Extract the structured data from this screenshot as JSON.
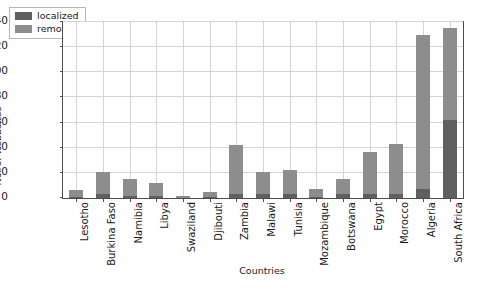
{
  "chart_data": {
    "type": "bar",
    "subtype": "stacked-vertical-bar",
    "title": "",
    "xlabel": "Countries",
    "ylabel": "No. of webbsites",
    "ylim": [
      0,
      140
    ],
    "yticks": [
      0,
      20,
      40,
      60,
      80,
      100,
      120,
      140
    ],
    "ytick_labels": [
      "0",
      "20",
      "40",
      "60",
      "80",
      "100",
      "120",
      "140"
    ],
    "grid": true,
    "legend_position": "upper left",
    "categories": [
      "Lesotho",
      "Burkina Faso",
      "Namibia",
      "Libya",
      "Swaziland",
      "Djibouti",
      "Zambia",
      "Malawi",
      "Tunisia",
      "Mozambique",
      "Botswana",
      "Egypt",
      "Morocco",
      "Algeria",
      "South Africa"
    ],
    "series": [
      {
        "name": "localized",
        "color": "#5f5f5f",
        "values": [
          1,
          3,
          2,
          2,
          0,
          1,
          3,
          3,
          3,
          1,
          3,
          3,
          3,
          7,
          62
        ]
      },
      {
        "name": "remote",
        "color": "#8d8d8d",
        "values": [
          5,
          18,
          13,
          10,
          2,
          4,
          39,
          18,
          19,
          6,
          12,
          34,
          40,
          123,
          73
        ]
      }
    ],
    "totals": [
      6,
      21,
      15,
      12,
      2,
      5,
      42,
      21,
      22,
      7,
      15,
      37,
      43,
      130,
      135
    ]
  },
  "legend": {
    "items": [
      {
        "label": "localized",
        "color": "#5f5f5f"
      },
      {
        "label": "remote",
        "color": "#8d8d8d"
      }
    ]
  },
  "colors": {
    "localized": "#5f5f5f",
    "remote": "#8d8d8d",
    "grid": "#d4d4d4",
    "axis": "#4d4d4d",
    "background": "#ffffff"
  }
}
